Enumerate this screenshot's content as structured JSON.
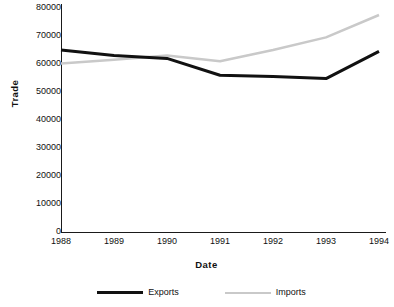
{
  "chart_data": {
    "type": "line",
    "title": "",
    "xlabel": "Date",
    "ylabel": "Trade",
    "categories": [
      "1988",
      "1989",
      "1990",
      "1991",
      "1992",
      "1993",
      "1994"
    ],
    "x": [
      1988,
      1989,
      1990,
      1991,
      1992,
      1993,
      1994
    ],
    "xlim": [
      1988,
      1994
    ],
    "ylim": [
      0,
      80000
    ],
    "yticks": [
      0,
      10000,
      20000,
      30000,
      40000,
      50000,
      60000,
      70000,
      80000
    ],
    "ytick_labels": [
      "0",
      "10000",
      "20000",
      "30000",
      "40000",
      "50000",
      "60000",
      "70000",
      "80000"
    ],
    "grid": false,
    "legend_position": "bottom-center",
    "series": [
      {
        "name": "Exports",
        "color": "#111111",
        "line_width": 3,
        "values": [
          65000,
          63000,
          62000,
          56000,
          55500,
          54800,
          64500
        ]
      },
      {
        "name": "Imports",
        "color": "#c9c9c9",
        "line_width": 2.5,
        "values": [
          60200,
          61500,
          63000,
          61000,
          65000,
          69500,
          77500
        ]
      }
    ]
  },
  "legend": {
    "items": [
      {
        "label": "Exports",
        "color": "#111111"
      },
      {
        "label": "Imports",
        "color": "#c9c9c9"
      }
    ]
  }
}
